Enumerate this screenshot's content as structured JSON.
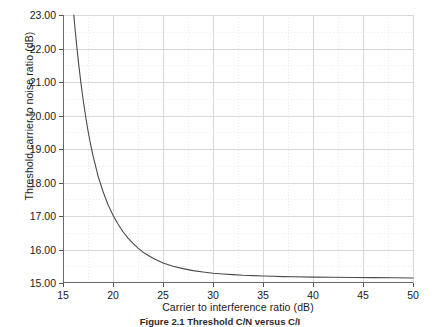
{
  "chart_data": {
    "type": "line",
    "title": "",
    "xlabel": "Carrier to interference ratio (dB)",
    "ylabel": "Threshold carrier to noise ratio (dB)",
    "xlim": [
      15,
      50
    ],
    "ylim": [
      15,
      23
    ],
    "xticks": [
      15,
      20,
      25,
      30,
      35,
      40,
      45,
      50
    ],
    "xticklabels": [
      "15",
      "20",
      "25",
      "30",
      "35",
      "40",
      "45",
      "50"
    ],
    "yticks": [
      15,
      16,
      17,
      18,
      19,
      20,
      21,
      22,
      23
    ],
    "yticklabels": [
      "15.00",
      "16.00",
      "17.00",
      "18.00",
      "19.00",
      "20.00",
      "21.00",
      "22.00",
      "23.00"
    ],
    "grid": true,
    "grid_major_color": "#d9d9d9",
    "grid_minor_color": "#ececec",
    "legend": "none",
    "line_color": "#4a4a4a",
    "line_width": 1.1,
    "series": [
      {
        "name": "Threshold C/N vs C/I",
        "x": [
          16.08,
          16.2,
          16.4,
          16.6,
          16.8,
          17.0,
          17.25,
          17.5,
          17.75,
          18.0,
          18.5,
          19.0,
          19.5,
          20.0,
          20.5,
          21.0,
          21.5,
          22.0,
          22.5,
          23.0,
          24.0,
          25.0,
          26.0,
          27.0,
          28.0,
          29.0,
          30.0,
          31.0,
          32.0,
          33.0,
          34.0,
          35.0,
          36.0,
          37.0,
          38.0,
          40.0,
          42.0,
          44.0,
          46.0,
          48.0,
          50.0
        ],
        "y": [
          23.0,
          22.6,
          22.0,
          21.45,
          20.95,
          20.5,
          20.0,
          19.55,
          19.15,
          18.8,
          18.2,
          17.73,
          17.34,
          17.02,
          16.76,
          16.53,
          16.34,
          16.18,
          16.04,
          15.92,
          15.74,
          15.6,
          15.5,
          15.43,
          15.37,
          15.33,
          15.29,
          15.27,
          15.25,
          15.23,
          15.22,
          15.21,
          15.2,
          15.19,
          15.185,
          15.175,
          15.17,
          15.165,
          15.16,
          15.155,
          15.15
        ]
      }
    ]
  },
  "caption": {
    "text": "Figure 2.1  Threshold C/N versus C/I"
  }
}
